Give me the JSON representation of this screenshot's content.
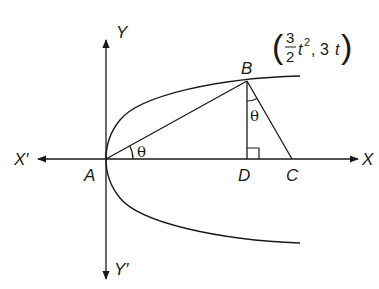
{
  "diagram": {
    "type": "geometry-parabola",
    "curve": "parabola y^2 = 6x (vertex at A, opening right)",
    "axes": {
      "x_positive": "X",
      "x_negative": "X′",
      "y_positive": "Y",
      "y_negative": "Y′"
    },
    "points": {
      "A": "A",
      "B": "B",
      "C": "C",
      "D": "D"
    },
    "point_B_coordinates": {
      "open": "(",
      "numerator": "3",
      "denominator": "2",
      "t": "t",
      "exp": "2",
      "sep": ", 3",
      "t2": "t",
      "close": ")"
    },
    "angles": {
      "at_A": "θ",
      "at_B": "θ"
    },
    "right_angle_at": "D",
    "segments": [
      "AB",
      "BD",
      "BC",
      "AD",
      "DC"
    ],
    "colors": {
      "stroke": "#1a1a1a",
      "background": "#ffffff"
    }
  }
}
